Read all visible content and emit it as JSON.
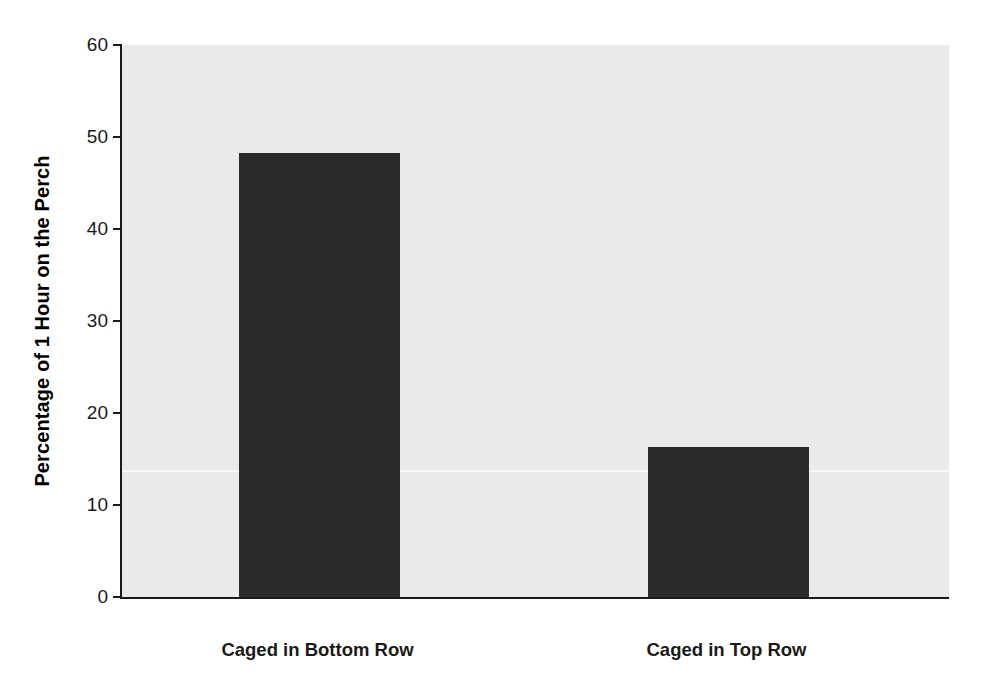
{
  "chart_data": {
    "type": "bar",
    "title": "",
    "subtitle": "",
    "xlabel": "",
    "ylabel": "Percentage of 1 Hour on the Perch",
    "categories": [
      "Caged in Bottom Row",
      "Caged in Top Row"
    ],
    "values": [
      48.3,
      16.3
    ],
    "series": [
      {
        "name": "Percentage of 1 Hour on the Perch",
        "values": [
          48.3,
          16.3
        ]
      }
    ],
    "ylim": [
      0,
      60
    ],
    "y_ticks": [
      0,
      10,
      20,
      30,
      40,
      50,
      60
    ],
    "y_tick_labels": [
      "0",
      "10",
      "20",
      "30",
      "40",
      "50",
      "60"
    ],
    "x_ticks": [],
    "x_tick_labels": [],
    "grid": false,
    "legend": false,
    "legend_position": "none",
    "annotations": [],
    "bar_color": "#2b2b2b",
    "plot_background": "#ededed",
    "figure_background": "#ffffff",
    "axis_color": "#1a1a1a"
  }
}
